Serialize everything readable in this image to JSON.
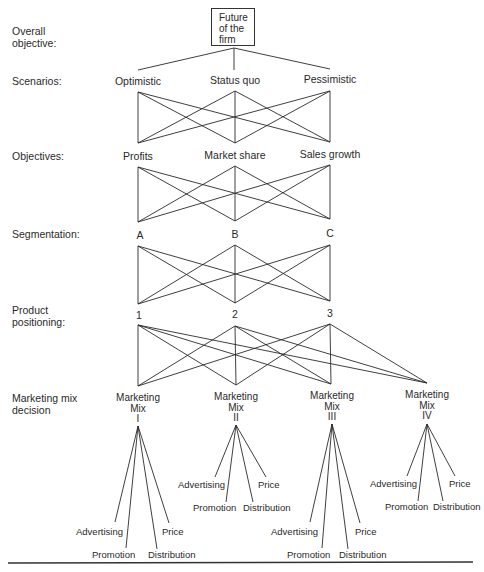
{
  "overall": {
    "row_label": "Overall\nobjective:",
    "box_lines": [
      "Future",
      "of the",
      "firm"
    ]
  },
  "scenarios": {
    "row_label": "Scenarios:",
    "nodes": [
      "Optimistic",
      "Status quo",
      "Pessimistic"
    ]
  },
  "objectives": {
    "row_label": "Objectives:",
    "nodes": [
      "Profits",
      "Market share",
      "Sales growth"
    ]
  },
  "segmentation": {
    "row_label": "Segmentation:",
    "nodes": [
      "A",
      "B",
      "C"
    ]
  },
  "positioning": {
    "row_label_1": "Product",
    "row_label_2": "positioning:",
    "nodes": [
      "1",
      "2",
      "3"
    ]
  },
  "marketing_mix": {
    "row_label_1": "Marketing mix",
    "row_label_2": "decision",
    "nodes": [
      {
        "line1": "Marketing",
        "line2": "Mix",
        "numeral": "I"
      },
      {
        "line1": "Marketing",
        "line2": "Mix",
        "numeral": "II"
      },
      {
        "line1": "Marketing",
        "line2": "Mix",
        "numeral": "III"
      },
      {
        "line1": "Marketing",
        "line2": "Mix",
        "numeral": "IV"
      }
    ],
    "elements": [
      "Advertising",
      "Promotion",
      "Distribution",
      "Price"
    ]
  }
}
